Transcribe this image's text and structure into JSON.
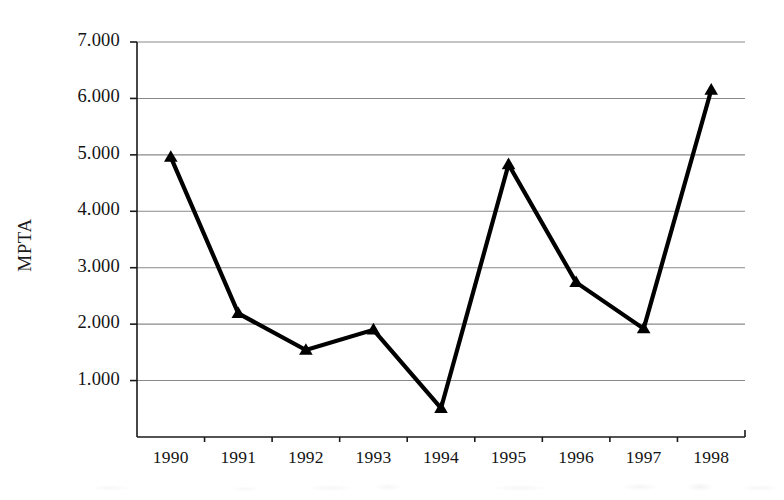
{
  "chart_data": {
    "type": "line",
    "title": "",
    "xlabel": "",
    "ylabel": "MPTA",
    "categories": [
      "1990",
      "1991",
      "1992",
      "1993",
      "1994",
      "1995",
      "1996",
      "1997",
      "1998"
    ],
    "values": [
      4.96,
      2.19,
      1.54,
      1.9,
      0.51,
      4.83,
      2.74,
      1.92,
      6.15
    ],
    "series": [
      {
        "name": "MPTA",
        "values": [
          4.96,
          2.19,
          1.54,
          1.9,
          0.51,
          4.83,
          2.74,
          1.92,
          6.15
        ]
      }
    ],
    "ylim": [
      0,
      7
    ],
    "y_ticks": [
      0,
      1,
      2,
      3,
      4,
      5,
      6,
      7
    ],
    "y_tick_labels": [
      "",
      "1.000",
      "2.000",
      "3.000",
      "4.000",
      "5.000",
      "6.000",
      "7.000"
    ],
    "x_tick_labels": [
      "1990",
      "1991",
      "1992",
      "1993",
      "1994",
      "1995",
      "1996",
      "1997",
      "1998"
    ],
    "grid": "horizontal",
    "legend": "none",
    "marker": "triangle-up",
    "line_color": "#000000",
    "grid_color": "#8a8a8a",
    "axis_color": "#1a1a1a",
    "background_color": "#ffffff"
  },
  "axes": {
    "y_title": "MPTA",
    "y_labels": [
      {
        "text": "7.000",
        "value": 7
      },
      {
        "text": "6.000",
        "value": 6
      },
      {
        "text": "5.000",
        "value": 5
      },
      {
        "text": "4.000",
        "value": 4
      },
      {
        "text": "3.000",
        "value": 3
      },
      {
        "text": "2.000",
        "value": 2
      },
      {
        "text": "1.000",
        "value": 1
      }
    ],
    "x_labels": [
      {
        "text": "1990"
      },
      {
        "text": "1991"
      },
      {
        "text": "1992"
      },
      {
        "text": "1993"
      },
      {
        "text": "1994"
      },
      {
        "text": "1995"
      },
      {
        "text": "1996"
      },
      {
        "text": "1997"
      },
      {
        "text": "1998"
      }
    ]
  }
}
